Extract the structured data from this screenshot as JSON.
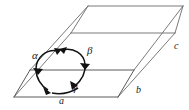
{
  "figure": {
    "type": "geometric-diagram",
    "background_color": "#ffffff",
    "edge_color": "#6b6b6b",
    "arc_color": "#111111",
    "label_color": "#1a1a1a"
  },
  "labels": {
    "edge_a": "a",
    "edge_b": "b",
    "edge_c": "c",
    "angle_alpha": "α",
    "angle_beta": "β",
    "angle_gamma": "γ"
  },
  "geometry": {
    "description": "Parallelepiped (unit cell) drawn in oblique projection",
    "vertices": {
      "origin_front_bottom_left": [
        14,
        97
      ],
      "front_bottom_right": [
        118,
        97
      ],
      "front_top_left": [
        30,
        70
      ],
      "front_top_right": [
        134,
        70
      ],
      "back_bottom_left": [
        71,
        33
      ],
      "back_bottom_right": [
        175,
        33
      ],
      "back_top_left": [
        88,
        6
      ],
      "back_top_right": [
        183,
        6
      ]
    },
    "axes": [
      {
        "name": "a",
        "from": "origin_front_bottom_left",
        "to": "front_bottom_right"
      },
      {
        "name": "b",
        "from": "front_bottom_right",
        "to": "back_bottom_right"
      },
      {
        "name": "c",
        "from": "origin_front_bottom_left",
        "to": "back_bottom_left"
      }
    ],
    "angles": [
      {
        "name": "α",
        "between": [
          "b",
          "c"
        ]
      },
      {
        "name": "β",
        "between": [
          "a",
          "c"
        ]
      },
      {
        "name": "γ",
        "between": [
          "a",
          "b"
        ]
      }
    ]
  }
}
